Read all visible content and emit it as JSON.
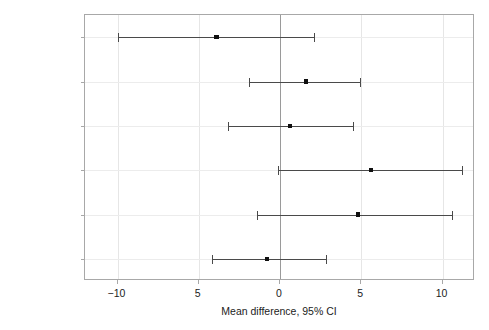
{
  "chart_data": {
    "type": "scatter",
    "subtype": "forest-plot",
    "title": "",
    "xlabel": "Mean difference, 95% CI",
    "ylabel": "",
    "xlim": [
      -12,
      12
    ],
    "xticks": [
      -10,
      -5,
      0,
      5,
      10
    ],
    "xtick_labels": [
      "−10",
      "5",
      "0",
      "5",
      "10"
    ],
    "grid": true,
    "legend": null,
    "reference_line": 0,
    "categories": [
      "omni-insecti",
      "omni-herbi",
      "omni-carni",
      "insecti-herbi",
      "insecti-carni",
      "herbi-carni"
    ],
    "rows": [
      {
        "label": "omni-insecti",
        "estimate": -3.9,
        "ci_low": -10.0,
        "ci_high": 2.1
      },
      {
        "label": "omni-herbi",
        "estimate": 1.6,
        "ci_low": -1.9,
        "ci_high": 4.9
      },
      {
        "label": "omni-carni",
        "estimate": 0.6,
        "ci_low": -3.2,
        "ci_high": 4.5
      },
      {
        "label": "insecti-herbi",
        "estimate": 5.6,
        "ci_low": -0.1,
        "ci_high": 11.2
      },
      {
        "label": "insecti-carni",
        "estimate": 4.8,
        "ci_low": -1.4,
        "ci_high": 10.6
      },
      {
        "label": "herbi-carni",
        "estimate": -0.8,
        "ci_low": -4.2,
        "ci_high": 2.8
      }
    ],
    "values": [
      -3.9,
      1.6,
      0.6,
      5.6,
      4.8,
      -0.8
    ],
    "colors": {
      "marker": "#101010",
      "ci": "#4a4a4a",
      "frame": "#a8a8a8",
      "grid": "#e6e6e6",
      "zero_line": "#9a9a9a",
      "text": "#1c1c1c",
      "background": "#ffffff"
    }
  }
}
